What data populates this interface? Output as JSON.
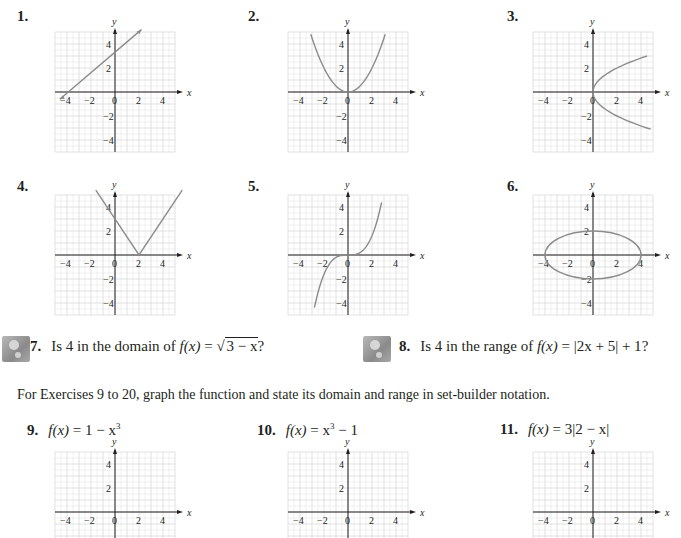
{
  "exercises_graphs": [
    {
      "number": "1.",
      "curve": "line",
      "description": "line through (-4,-1)...(2,5), y-intercept 3"
    },
    {
      "number": "2.",
      "curve": "parabola",
      "description": "upward parabola vertex (0,0)"
    },
    {
      "number": "3.",
      "curve": "sideways-parabola",
      "description": "x = y^2/3 opening right, vertex (0,0)"
    },
    {
      "number": "4.",
      "curve": "absolute-value",
      "description": "V-shape vertex (2,0)"
    },
    {
      "number": "5.",
      "curve": "cubic",
      "description": "cubic through origin"
    },
    {
      "number": "6.",
      "curve": "ellipse",
      "description": "ellipse x-radius 4, y-radius 2"
    }
  ],
  "axis_labels": {
    "x": "x",
    "y": "y"
  },
  "tick_labels": {
    "x": [
      "-4",
      "-2",
      "0",
      "2",
      "4"
    ],
    "y": [
      "4",
      "2",
      "-2",
      "-4"
    ]
  },
  "questions": [
    {
      "number": "7.",
      "text_prefix": "Is 4 in the domain of ",
      "func": "f(x)",
      "eq": " = ",
      "expr": "3 − x",
      "suffix": "?"
    },
    {
      "number": "8.",
      "text_prefix": "Is 4 in the range of ",
      "func": "f(x)",
      "eq": " = ",
      "expr": "|2x + 5| + 1",
      "suffix": "?"
    }
  ],
  "instructions": "For Exercises 9 to 20, graph the function and state its domain and range in set-builder notation.",
  "functions": [
    {
      "number": "9.",
      "lhs": "f(x)",
      "rhs": " = 1 − x",
      "sup": "3"
    },
    {
      "number": "10.",
      "lhs": "f(x)",
      "rhs": " = x",
      "sup": "3",
      "tail": " − 1"
    },
    {
      "number": "11.",
      "lhs": "f(x)",
      "rhs": " = 3|2 − x|"
    }
  ],
  "colors": {
    "curve": "#8c8c8c",
    "axis": "#231f20",
    "grid": "#d9d9d9",
    "text": "#231f20"
  }
}
